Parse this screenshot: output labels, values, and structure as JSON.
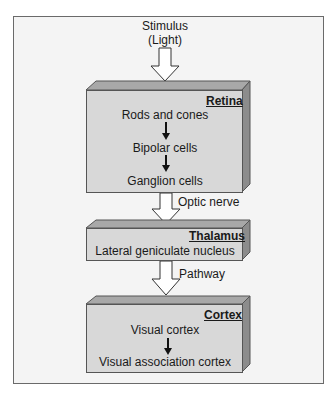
{
  "diagram": {
    "input": {
      "line1": "Stimulus",
      "line2": "(Light)"
    },
    "stages": [
      {
        "title": "Retina",
        "items": [
          "Rods and cones",
          "Bipolar cells",
          "Ganglion cells"
        ]
      },
      {
        "title": "Thalamus",
        "items": [
          "Lateral geniculate nucleus"
        ]
      },
      {
        "title": "Cortex",
        "items": [
          "Visual cortex",
          "Visual association cortex"
        ]
      }
    ],
    "connectors": [
      {
        "from": "Retina",
        "to": "Thalamus",
        "label": "Optic nerve"
      },
      {
        "from": "Thalamus",
        "to": "Cortex",
        "label": "Pathway"
      }
    ]
  },
  "colors": {
    "box_front": "#d8d8d8",
    "box_top": "#a8a8a8",
    "box_side": "#8c8c8c",
    "frame_bg": "#f4f4f4"
  }
}
